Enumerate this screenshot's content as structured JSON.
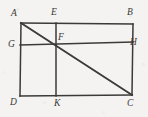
{
  "figure": {
    "kind": "plane-geometry-diagram",
    "canvas": {
      "width": 148,
      "height": 117
    },
    "colors": {
      "background": "#f4f3f1",
      "stroke": "#3a3a3a",
      "label": "#383838"
    },
    "stroke_width": 1.5,
    "diagonal_stroke_width": 1.9,
    "vertices": [
      {
        "name": "A",
        "label": "A",
        "x": 21,
        "y": 23,
        "label_x": 11,
        "label_y": 9,
        "role": "rectangle-corner-top-left"
      },
      {
        "name": "E",
        "label": "E",
        "x": 56,
        "y": 23,
        "label_x": 51,
        "label_y": 8,
        "role": "point-on-top-edge"
      },
      {
        "name": "B",
        "label": "B",
        "x": 133,
        "y": 24,
        "label_x": 127,
        "label_y": 8,
        "role": "rectangle-corner-top-right"
      },
      {
        "name": "G",
        "label": "G",
        "x": 20,
        "y": 45,
        "label_x": 8,
        "label_y": 40,
        "role": "point-on-left-edge"
      },
      {
        "name": "F",
        "label": "F",
        "x": 56,
        "y": 44,
        "label_x": 58,
        "label_y": 33,
        "role": "intersection-point"
      },
      {
        "name": "H",
        "label": "H",
        "x": 133,
        "y": 42,
        "label_x": 130,
        "label_y": 38,
        "role": "point-on-right-edge"
      },
      {
        "name": "D",
        "label": "D",
        "x": 20,
        "y": 96,
        "label_x": 10,
        "label_y": 98,
        "role": "rectangle-corner-bottom-left"
      },
      {
        "name": "K",
        "label": "K",
        "x": 56,
        "y": 96,
        "label_x": 54,
        "label_y": 99,
        "role": "point-on-bottom-edge"
      },
      {
        "name": "C",
        "label": "C",
        "x": 132,
        "y": 95,
        "label_x": 127,
        "label_y": 99,
        "role": "rectangle-corner-bottom-right"
      }
    ],
    "segments": [
      {
        "name": "AB",
        "from": "A",
        "to": "B",
        "x1": 21,
        "y1": 23,
        "x2": 133,
        "y2": 24,
        "kind": "rectangle-side-top"
      },
      {
        "name": "BC",
        "from": "B",
        "to": "C",
        "x1": 133,
        "y1": 24,
        "x2": 132,
        "y2": 95,
        "kind": "rectangle-side-right"
      },
      {
        "name": "CD",
        "from": "C",
        "to": "D",
        "x1": 132,
        "y1": 95,
        "x2": 20,
        "y2": 96,
        "kind": "rectangle-side-bottom"
      },
      {
        "name": "DA",
        "from": "D",
        "to": "A",
        "x1": 20,
        "y1": 96,
        "x2": 21,
        "y2": 23,
        "kind": "rectangle-side-left"
      },
      {
        "name": "EK",
        "from": "E",
        "to": "K",
        "x1": 56,
        "y1": 23,
        "x2": 56,
        "y2": 96,
        "kind": "vertical-cevian"
      },
      {
        "name": "GH",
        "from": "G",
        "to": "H",
        "x1": 20,
        "y1": 45,
        "x2": 133,
        "y2": 42,
        "kind": "horizontal-cevian"
      },
      {
        "name": "AC",
        "from": "A",
        "to": "C",
        "x1": 21,
        "y1": 23,
        "x2": 132,
        "y2": 95,
        "kind": "diagonal"
      }
    ]
  }
}
